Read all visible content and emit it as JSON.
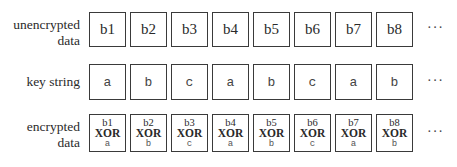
{
  "rows": {
    "unencrypted": {
      "label_line1": "unencrypted",
      "label_line2": "data",
      "cells": [
        "b1",
        "b2",
        "b3",
        "b4",
        "b5",
        "b6",
        "b7",
        "b8"
      ]
    },
    "key": {
      "label": "key string",
      "cells": [
        "a",
        "b",
        "c",
        "a",
        "b",
        "c",
        "a",
        "b"
      ]
    },
    "encrypted": {
      "label_line1": "encrypted",
      "label_line2": "data",
      "cells": [
        {
          "byte": "b1",
          "op": "XOR",
          "key": "a"
        },
        {
          "byte": "b2",
          "op": "XOR",
          "key": "b"
        },
        {
          "byte": "b3",
          "op": "XOR",
          "key": "c"
        },
        {
          "byte": "b4",
          "op": "XOR",
          "key": "a"
        },
        {
          "byte": "b5",
          "op": "XOR",
          "key": "b"
        },
        {
          "byte": "b6",
          "op": "XOR",
          "key": "c"
        },
        {
          "byte": "b7",
          "op": "XOR",
          "key": "a"
        },
        {
          "byte": "b8",
          "op": "XOR",
          "key": "b"
        }
      ]
    }
  },
  "ellipsis": "···"
}
